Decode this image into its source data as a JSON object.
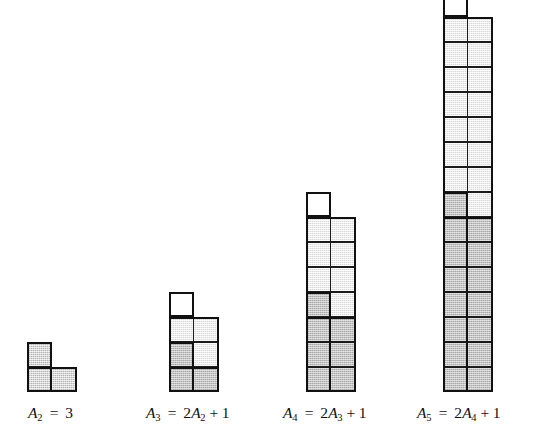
{
  "figure": {
    "baseline_y": 392,
    "cell_size": 25,
    "colors": {
      "outline": "#111111",
      "grid_line": "#1b1b1b",
      "fill_white": "#ffffff",
      "fill_light": "#d8d8d8",
      "fill_mid": "#b4b4b4",
      "fill_dark": "#a8a8a8",
      "background": "#ffffff"
    },
    "groups": [
      {
        "id": "a2",
        "name": "group-a2",
        "left": 27,
        "stack_left": 0,
        "cols": 2,
        "rows": 2,
        "caption": {
          "left": 28,
          "top": 404,
          "symbol": "A",
          "index": "2",
          "operator": "=",
          "expression": "3",
          "full_text": "A2 = 3"
        },
        "grid": [
          [
            "mid",
            "none"
          ],
          [
            "mid",
            "mid"
          ]
        ],
        "outlines": [
          {
            "x": 0,
            "y": 0,
            "w": 25,
            "h": 50
          },
          {
            "x": 0,
            "y": 25,
            "w": 50,
            "h": 25
          }
        ]
      },
      {
        "id": "a3",
        "name": "group-a3",
        "left": 169,
        "stack_left": 0,
        "cols": 2,
        "rows": 4,
        "caption": {
          "left": 146,
          "top": 404,
          "symbol": "A",
          "index": "3",
          "operator": "=",
          "expression": "2A2 + 1",
          "full_text": "A3 = 2A2 + 1"
        },
        "grid": [
          [
            "white",
            "none"
          ],
          [
            "light",
            "light"
          ],
          [
            "dark",
            "light"
          ],
          [
            "dark",
            "dark"
          ]
        ],
        "outlines": [
          {
            "x": 0,
            "y": 0,
            "w": 25,
            "h": 25
          },
          {
            "x": 0,
            "y": 25,
            "w": 50,
            "h": 75
          },
          {
            "x": 0,
            "y": 50,
            "w": 25,
            "h": 50
          },
          {
            "x": 0,
            "y": 75,
            "w": 50,
            "h": 25
          }
        ]
      },
      {
        "id": "a4",
        "name": "group-a4",
        "left": 306,
        "stack_left": 0,
        "cols": 2,
        "rows": 8,
        "caption": {
          "left": 283,
          "top": 404,
          "symbol": "A",
          "index": "4",
          "operator": "=",
          "expression": "2A3 + 1",
          "full_text": "A4 = 2A3 + 1"
        },
        "grid": [
          [
            "white",
            "none"
          ],
          [
            "light",
            "light"
          ],
          [
            "light",
            "light"
          ],
          [
            "light",
            "light"
          ],
          [
            "dark",
            "light"
          ],
          [
            "dark",
            "dark"
          ],
          [
            "dark",
            "dark"
          ],
          [
            "dark",
            "dark"
          ]
        ],
        "outlines": [
          {
            "x": 0,
            "y": 0,
            "w": 25,
            "h": 25
          },
          {
            "x": 0,
            "y": 25,
            "w": 50,
            "h": 175
          },
          {
            "x": 0,
            "y": 100,
            "w": 25,
            "h": 100
          },
          {
            "x": 0,
            "y": 125,
            "w": 50,
            "h": 75
          }
        ]
      },
      {
        "id": "a5",
        "name": "group-a5",
        "left": 443,
        "stack_left": 0,
        "cols": 2,
        "rows": 16,
        "caption": {
          "left": 417,
          "top": 404,
          "symbol": "A",
          "index": "5",
          "operator": "=",
          "expression": "2A4 + 1",
          "full_text": "A5 = 2A4 + 1"
        },
        "grid": [
          [
            "white",
            "none"
          ],
          [
            "light",
            "light"
          ],
          [
            "light",
            "light"
          ],
          [
            "light",
            "light"
          ],
          [
            "light",
            "light"
          ],
          [
            "light",
            "light"
          ],
          [
            "light",
            "light"
          ],
          [
            "light",
            "light"
          ],
          [
            "dark",
            "light"
          ],
          [
            "dark",
            "dark"
          ],
          [
            "dark",
            "dark"
          ],
          [
            "dark",
            "dark"
          ],
          [
            "dark",
            "dark"
          ],
          [
            "dark",
            "dark"
          ],
          [
            "dark",
            "dark"
          ],
          [
            "dark",
            "dark"
          ]
        ],
        "outlines": [
          {
            "x": 0,
            "y": 0,
            "w": 25,
            "h": 25
          },
          {
            "x": 0,
            "y": 25,
            "w": 50,
            "h": 375
          },
          {
            "x": 0,
            "y": 200,
            "w": 25,
            "h": 200
          },
          {
            "x": 0,
            "y": 225,
            "w": 50,
            "h": 175
          }
        ]
      }
    ]
  }
}
